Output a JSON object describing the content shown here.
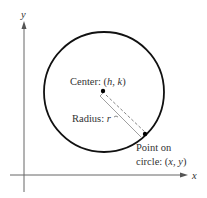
{
  "diagram": {
    "axes": {
      "x_label": "x",
      "y_label": "y"
    },
    "center_label": "Center:",
    "center_coords": {
      "open": "(",
      "h": "h",
      "sep": ",",
      "k": "k",
      "close": ")"
    },
    "radius_label": "Radius:",
    "radius_symbol": "r",
    "point_label_line1": "Point on",
    "point_label_line2": "circle:",
    "point_coords": {
      "open": "(",
      "x": "x",
      "sep": ",",
      "y": "y",
      "close": ")"
    },
    "colors": {
      "stroke": "#111111",
      "axis": "#555555",
      "radius": "#777777"
    }
  }
}
